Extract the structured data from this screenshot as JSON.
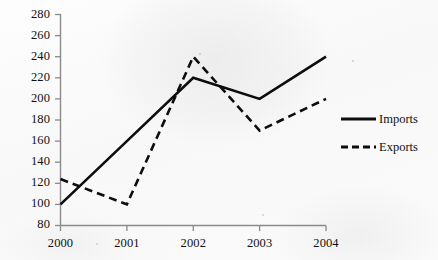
{
  "chart_data": {
    "type": "line",
    "title": "",
    "xlabel": "",
    "ylabel": "",
    "categories": [
      "2000",
      "2001",
      "2002",
      "2003",
      "2004"
    ],
    "x": [
      2000,
      2001,
      2002,
      2003,
      2004
    ],
    "xlim": [
      2000,
      2004
    ],
    "ylim": [
      80,
      280
    ],
    "yticks": [
      80,
      100,
      120,
      140,
      160,
      180,
      200,
      220,
      240,
      260,
      280
    ],
    "xticks": [
      "2000",
      "2001",
      "2002",
      "2003",
      "2004"
    ],
    "grid": false,
    "legend_position": "right",
    "series": [
      {
        "name": "Imports",
        "values": [
          100,
          160,
          220,
          200,
          240
        ],
        "style": "solid",
        "color": "#0d0d0d"
      },
      {
        "name": "Exports",
        "values": [
          124,
          100,
          240,
          170,
          200
        ],
        "style": "dashed",
        "color": "#0d0d0d"
      }
    ]
  },
  "axes": {
    "y_tick_labels": [
      "280",
      "260",
      "240",
      "220",
      "200",
      "180",
      "160",
      "140",
      "120",
      "100",
      "80"
    ],
    "x_tick_labels": [
      "2000",
      "2001",
      "2002",
      "2003",
      "2004"
    ],
    "axis_color": "#8a8a8a"
  },
  "legend": {
    "items": [
      {
        "label": "Imports",
        "style": "solid"
      },
      {
        "label": "Exports",
        "style": "dashed"
      }
    ]
  }
}
